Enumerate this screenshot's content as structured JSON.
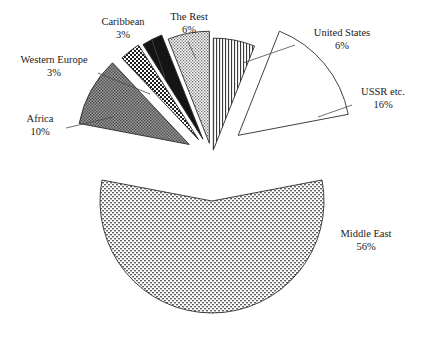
{
  "chart_data": {
    "type": "pie",
    "title": "",
    "subtitle": "",
    "xlabel": "",
    "ylabel": "",
    "legend_position": "none",
    "grid": false,
    "units": "percent",
    "exploded": true,
    "categories": [
      "United States",
      "USSR etc.",
      "Middle East",
      "Africa",
      "Western Europe",
      "Caribbean",
      "The Rest"
    ],
    "values": [
      6,
      16,
      56,
      10,
      3,
      3,
      6
    ],
    "slices": [
      {
        "label": "United States",
        "percent_text": "6%",
        "value": 6,
        "fill_pattern": "vertical-lines",
        "fill_color": "#ffffff",
        "start_angle_deg": 0,
        "end_angle_deg": 21.6
      },
      {
        "label": "USSR etc.",
        "percent_text": "16%",
        "value": 16,
        "fill_pattern": "solid-white",
        "fill_color": "#ffffff",
        "start_angle_deg": 21.6,
        "end_angle_deg": 79.2
      },
      {
        "label": "Middle East",
        "percent_text": "56%",
        "value": 56,
        "fill_pattern": "brick-weave",
        "fill_color": "#9a9a9a",
        "start_angle_deg": 79.2,
        "end_angle_deg": 280.8
      },
      {
        "label": "Africa",
        "percent_text": "10%",
        "value": 10,
        "fill_pattern": "coarse-dots",
        "fill_color": "#8c8c8c",
        "start_angle_deg": 280.8,
        "end_angle_deg": 316.8
      },
      {
        "label": "Western Europe",
        "percent_text": "3%",
        "value": 3,
        "fill_pattern": "checkerboard",
        "fill_color": "#4d4d4d",
        "start_angle_deg": 316.8,
        "end_angle_deg": 327.6
      },
      {
        "label": "Caribbean",
        "percent_text": "3%",
        "value": 3,
        "fill_pattern": "solid-black",
        "fill_color": "#141414",
        "start_angle_deg": 327.6,
        "end_angle_deg": 338.4
      },
      {
        "label": "The Rest",
        "percent_text": "6%",
        "value": 6,
        "fill_pattern": "fine-stipple",
        "fill_color": "#9e9e9e",
        "start_angle_deg": 338.4,
        "end_angle_deg": 360
      }
    ]
  },
  "labels": {
    "western_europe": {
      "name": "Western Europe",
      "percent": "3%"
    },
    "caribbean": {
      "name": "Caribbean",
      "percent": "3%"
    },
    "the_rest": {
      "name": "The Rest",
      "percent": "6%"
    },
    "united_states": {
      "name": "United States",
      "percent": "6%"
    },
    "ussr": {
      "name": "USSR etc.",
      "percent": "16%"
    },
    "africa": {
      "name": "Africa",
      "percent": "10%"
    },
    "middle_east": {
      "name": "Middle East",
      "percent": "56%"
    }
  },
  "colors": {
    "background": "#ffffff",
    "outline": "#2b2b2b",
    "text": "#1a1a1a",
    "leader": "#4a4a4a"
  }
}
